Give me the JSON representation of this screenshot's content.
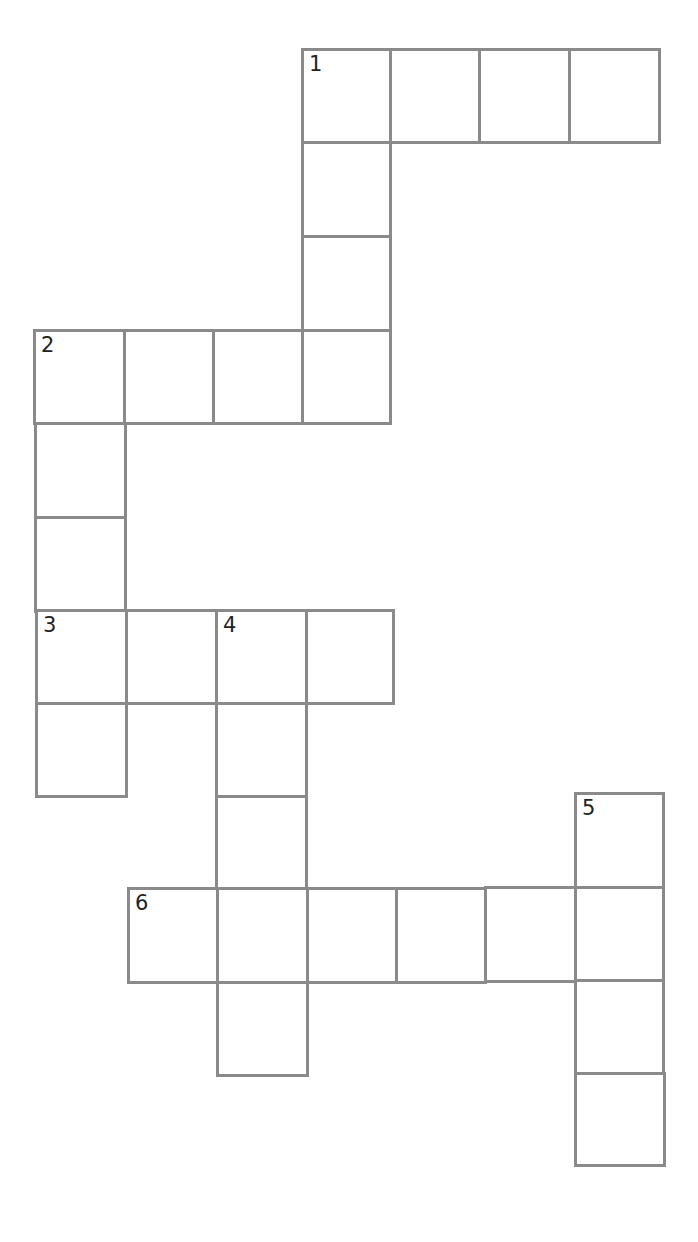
{
  "puzzle": {
    "type": "crossword",
    "cell_border_color": "#8a8a8a",
    "background_color": "#ffffff",
    "number_color": "#222222",
    "cells": [
      {
        "id": "r0c3",
        "x": 301,
        "y": 48,
        "w": 91,
        "h": 96,
        "number": "1",
        "value": ""
      },
      {
        "id": "r0c4",
        "x": 389,
        "y": 48,
        "w": 92,
        "h": 96,
        "number": "",
        "value": ""
      },
      {
        "id": "r0c5",
        "x": 478,
        "y": 48,
        "w": 93,
        "h": 96,
        "number": "",
        "value": ""
      },
      {
        "id": "r0c6",
        "x": 568,
        "y": 48,
        "w": 93,
        "h": 96,
        "number": "",
        "value": ""
      },
      {
        "id": "r1c3",
        "x": 301,
        "y": 141,
        "w": 91,
        "h": 97,
        "number": "",
        "value": ""
      },
      {
        "id": "r2c3",
        "x": 301,
        "y": 235,
        "w": 91,
        "h": 97,
        "number": "",
        "value": ""
      },
      {
        "id": "r3c0",
        "x": 33,
        "y": 329,
        "w": 93,
        "h": 96,
        "number": "2",
        "value": ""
      },
      {
        "id": "r3c1",
        "x": 123,
        "y": 329,
        "w": 92,
        "h": 96,
        "number": "",
        "value": ""
      },
      {
        "id": "r3c2",
        "x": 212,
        "y": 329,
        "w": 92,
        "h": 96,
        "number": "",
        "value": ""
      },
      {
        "id": "r3c3",
        "x": 301,
        "y": 329,
        "w": 91,
        "h": 96,
        "number": "",
        "value": ""
      },
      {
        "id": "r4c0",
        "x": 34,
        "y": 422,
        "w": 93,
        "h": 97,
        "number": "",
        "value": ""
      },
      {
        "id": "r5c0",
        "x": 34,
        "y": 516,
        "w": 93,
        "h": 97,
        "number": "",
        "value": ""
      },
      {
        "id": "r6c0",
        "x": 35,
        "y": 609,
        "w": 93,
        "h": 96,
        "number": "3",
        "value": ""
      },
      {
        "id": "r6c1",
        "x": 125,
        "y": 609,
        "w": 93,
        "h": 96,
        "number": "",
        "value": ""
      },
      {
        "id": "r6c2",
        "x": 215,
        "y": 609,
        "w": 93,
        "h": 96,
        "number": "4",
        "value": ""
      },
      {
        "id": "r6c3",
        "x": 305,
        "y": 609,
        "w": 90,
        "h": 96,
        "number": "",
        "value": ""
      },
      {
        "id": "r7c0",
        "x": 35,
        "y": 702,
        "w": 93,
        "h": 96,
        "number": "",
        "value": ""
      },
      {
        "id": "r7c2",
        "x": 215,
        "y": 702,
        "w": 93,
        "h": 96,
        "number": "",
        "value": ""
      },
      {
        "id": "r8c2",
        "x": 215,
        "y": 795,
        "w": 93,
        "h": 95,
        "number": "",
        "value": ""
      },
      {
        "id": "r8c6",
        "x": 574,
        "y": 792,
        "w": 91,
        "h": 97,
        "number": "5",
        "value": ""
      },
      {
        "id": "r9c1",
        "x": 127,
        "y": 887,
        "w": 93,
        "h": 97,
        "number": "6",
        "value": ""
      },
      {
        "id": "r9c2",
        "x": 216,
        "y": 887,
        "w": 93,
        "h": 97,
        "number": "",
        "value": ""
      },
      {
        "id": "r9c3",
        "x": 306,
        "y": 887,
        "w": 92,
        "h": 97,
        "number": "",
        "value": ""
      },
      {
        "id": "r9c4",
        "x": 395,
        "y": 887,
        "w": 92,
        "h": 97,
        "number": "",
        "value": ""
      },
      {
        "id": "r9c5",
        "x": 484,
        "y": 886,
        "w": 93,
        "h": 97,
        "number": "",
        "value": ""
      },
      {
        "id": "r9c6",
        "x": 574,
        "y": 886,
        "w": 91,
        "h": 96,
        "number": "",
        "value": ""
      },
      {
        "id": "r10c2",
        "x": 216,
        "y": 981,
        "w": 93,
        "h": 96,
        "number": "",
        "value": ""
      },
      {
        "id": "r10c6",
        "x": 574,
        "y": 979,
        "w": 91,
        "h": 96,
        "number": "",
        "value": ""
      },
      {
        "id": "r11c6",
        "x": 574,
        "y": 1072,
        "w": 92,
        "h": 95,
        "number": "",
        "value": ""
      }
    ],
    "words": [
      {
        "number": "1",
        "direction": "across",
        "length": 4
      },
      {
        "number": "1",
        "direction": "down",
        "length": 4
      },
      {
        "number": "2",
        "direction": "across",
        "length": 4
      },
      {
        "number": "2",
        "direction": "down",
        "length": 5
      },
      {
        "number": "3",
        "direction": "across",
        "length": 4
      },
      {
        "number": "4",
        "direction": "down",
        "length": 5
      },
      {
        "number": "5",
        "direction": "down",
        "length": 4
      },
      {
        "number": "6",
        "direction": "across",
        "length": 6
      }
    ]
  }
}
